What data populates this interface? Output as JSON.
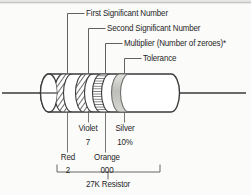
{
  "figure": {
    "subject": "27K Resistor",
    "ink_color": "#2b2b2b",
    "background_color": "#fbfbfa",
    "band_fill_color": "#d9d9d6",
    "silver_band_color": "#c9c9c6"
  },
  "callouts": {
    "band1": "First Significant Number",
    "band2": "Second Significant Number",
    "band3": "Multiplier (Number of zeroes)*",
    "band4": "Tolerance"
  },
  "bands": [
    {
      "index": 1,
      "color_name": "Red",
      "value": "2",
      "callout": "First Significant Number"
    },
    {
      "index": 2,
      "color_name": "Violet",
      "value": "7",
      "callout": "Second Significant Number"
    },
    {
      "index": 3,
      "color_name": "Orange",
      "value": "000",
      "callout": "Multiplier (Number of zeroes)*"
    },
    {
      "index": 4,
      "color_name": "Silver",
      "value": "10%",
      "callout": "Tolerance"
    }
  ],
  "result": {
    "label": "27K Resistor"
  }
}
